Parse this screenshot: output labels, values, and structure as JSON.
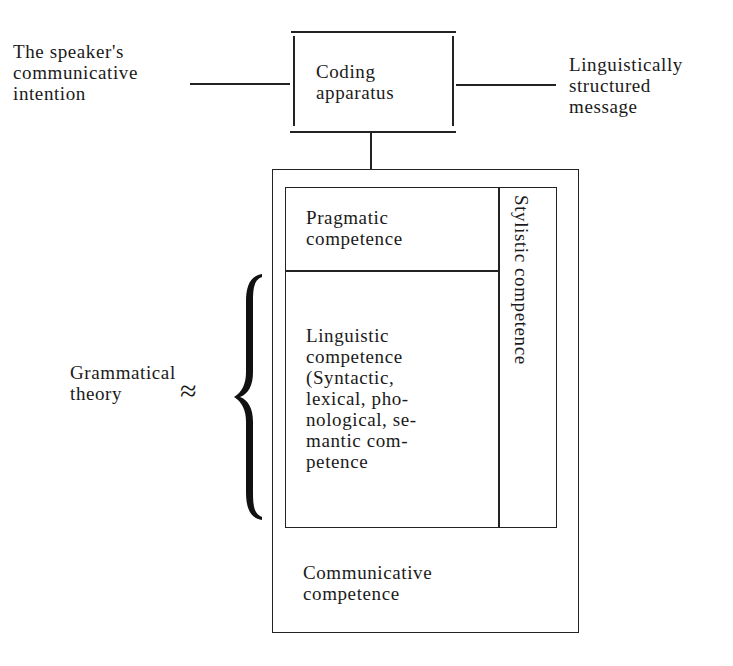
{
  "diagram": {
    "type": "block-diagram",
    "input_label": "The speaker's\ncommunicative\nintention",
    "coding_box": {
      "label": "Coding\napparatus"
    },
    "output_label": "Linguistically\nstructured\nmessage",
    "outer_box": {
      "label": "Communicative\ncompetence"
    },
    "pragmatic_box": {
      "label": "Pragmatic\ncompetence"
    },
    "linguistic_box": {
      "label": "Linguistic\ncompetence\n(Syntactic,\nlexical, pho-\nnological, se-\nmantic com-\npetence"
    },
    "stylistic_box": {
      "label": "Stylistic competence"
    },
    "theory_label": "Grammatical\ntheory",
    "approx_symbol": "≈",
    "line_color": "#222222",
    "background": "#ffffff"
  }
}
